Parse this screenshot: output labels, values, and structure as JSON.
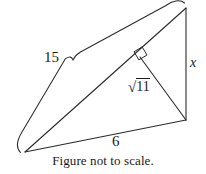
{
  "figure": {
    "type": "geometry-diagram",
    "shape": "right-triangle-with-altitude",
    "caption": "Figure not to scale.",
    "stroke_color": "#2b2b2b",
    "text_color": "#1a1a1a",
    "background_color": "#ffffff",
    "labels": {
      "hypotenuse": "15",
      "base": "6",
      "vertical_side": "x",
      "altitude_radical": "√",
      "altitude_radicand": "11",
      "altitude_full": "√11"
    },
    "geometry": {
      "vertices": {
        "left": [
          25,
          152
        ],
        "top_right": [
          186,
          8
        ],
        "bottom_right": [
          186,
          120
        ]
      },
      "altitude_foot": [
        140,
        57
      ],
      "right_angle_marker_at": [
        140,
        57
      ],
      "brace_spans": "hypotenuse",
      "brace_tip": [
        72,
        60
      ]
    }
  }
}
